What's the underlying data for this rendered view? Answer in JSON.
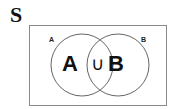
{
  "title": "S",
  "diagram": {
    "type": "venn",
    "universe_label": "S",
    "sets": [
      {
        "name": "A",
        "small_label": "A",
        "big_label": "A"
      },
      {
        "name": "B",
        "small_label": "B",
        "big_label": "B"
      }
    ],
    "operator_symbol": "∪",
    "expression": "A ∪ B",
    "colors": {
      "stroke": "#555555",
      "rect_stroke": "#888888",
      "text": "#111111",
      "background": "#ffffff"
    }
  }
}
